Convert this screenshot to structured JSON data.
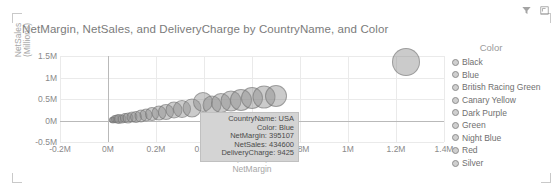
{
  "header": {
    "filter_icon": "filter-icon",
    "focus_icon": "focus-mode-icon"
  },
  "chart_title": "NetMargin, NetSales, and DeliveryCharge by CountryName, and Color",
  "legend": {
    "title": "Color",
    "items": [
      {
        "label": "Black"
      },
      {
        "label": "Blue"
      },
      {
        "label": "British Racing Green"
      },
      {
        "label": "Canary Yellow"
      },
      {
        "label": "Dark Purple"
      },
      {
        "label": "Green"
      },
      {
        "label": "Night Blue"
      },
      {
        "label": "Red"
      },
      {
        "label": "Silver"
      }
    ]
  },
  "tooltip": {
    "country_name": "CountryName: USA",
    "color": "Color: Blue",
    "net_margin": "NetMargin: 395107",
    "net_sales": "NetSales: 434600",
    "delivery_charge": "DeliveryCharge: 9425"
  },
  "chart_data": {
    "type": "scatter",
    "title": "NetMargin, NetSales, and DeliveryCharge by CountryName, and Color",
    "xlabel": "NetMargin",
    "xunit": "(Millions)",
    "ylabel": "NetSales",
    "yunit": "(Millions)",
    "xlim": [
      -200000,
      1400000
    ],
    "ylim": [
      -500000,
      1500000
    ],
    "xticks": [
      -200000,
      0,
      200000,
      400000,
      600000,
      800000,
      1000000,
      1200000,
      1400000
    ],
    "xticklabels": [
      "-0.2M",
      "0M",
      "0.2M",
      "0.4M",
      "0.6M",
      "0.8M",
      "1M",
      "1.2M",
      "1.4M"
    ],
    "yticks": [
      -500000,
      0,
      500000,
      1000000,
      1500000
    ],
    "yticklabels": [
      "-0.5M",
      "0M",
      "0.5M",
      "1M",
      "1.5M"
    ],
    "grid": true,
    "legend_position": "right",
    "size_field": "DeliveryCharge",
    "color_field": "Color",
    "detail_field": "CountryName",
    "points": [
      {
        "x": 15000,
        "y": 14000,
        "size": 4
      },
      {
        "x": 22000,
        "y": 20000,
        "size": 5
      },
      {
        "x": 30000,
        "y": 26000,
        "size": 6
      },
      {
        "x": 38000,
        "y": 30000,
        "size": 7
      },
      {
        "x": 47000,
        "y": 36000,
        "size": 8
      },
      {
        "x": 58000,
        "y": 42000,
        "size": 7
      },
      {
        "x": 70000,
        "y": 52000,
        "size": 8
      },
      {
        "x": 84000,
        "y": 62000,
        "size": 9
      },
      {
        "x": 100000,
        "y": 74000,
        "size": 9
      },
      {
        "x": 118000,
        "y": 88000,
        "size": 10
      },
      {
        "x": 138000,
        "y": 106000,
        "size": 11
      },
      {
        "x": 160000,
        "y": 126000,
        "size": 11
      },
      {
        "x": 185000,
        "y": 150000,
        "size": 12
      },
      {
        "x": 212000,
        "y": 176000,
        "size": 13
      },
      {
        "x": 242000,
        "y": 204000,
        "size": 14
      },
      {
        "x": 275000,
        "y": 236000,
        "size": 15
      },
      {
        "x": 310000,
        "y": 268000,
        "size": 16
      },
      {
        "x": 348000,
        "y": 302000,
        "size": 17
      },
      {
        "x": 395107,
        "y": 434600,
        "size": 18
      },
      {
        "x": 432000,
        "y": 372000,
        "size": 17
      },
      {
        "x": 470000,
        "y": 408000,
        "size": 18
      },
      {
        "x": 512000,
        "y": 444000,
        "size": 19
      },
      {
        "x": 556000,
        "y": 480000,
        "size": 20
      },
      {
        "x": 600000,
        "y": 512000,
        "size": 20
      },
      {
        "x": 648000,
        "y": 548000,
        "size": 21
      },
      {
        "x": 698000,
        "y": 580000,
        "size": 20
      },
      {
        "x": 1240000,
        "y": 1360000,
        "size": 26
      }
    ]
  },
  "colors": {
    "text": "#7b7b7b",
    "axis": "#b9b9b9",
    "grid": "#eaeaea",
    "bubble": "#8c8c8c",
    "tooltip_bg": "#d4d4d4"
  }
}
